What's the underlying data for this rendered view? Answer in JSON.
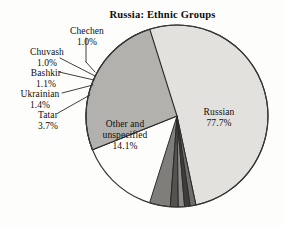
{
  "chart_data": {
    "type": "pie",
    "title": "Russia: Ethnic Groups",
    "xlabel": "",
    "ylabel": "",
    "legend": "none",
    "grid": false,
    "units": "percent",
    "categories": [
      "Russian",
      "Other and unspecified",
      "Tatar",
      "Ukrainian",
      "Bashkir",
      "Chuvash",
      "Chechen"
    ],
    "values": [
      77.7,
      14.1,
      3.7,
      1.4,
      1.1,
      1.0,
      1.0
    ],
    "slices": [
      {
        "name": "Russian",
        "label": "Russian",
        "value": 77.7,
        "value_text": "77.7%",
        "color": "#e2e1de",
        "label_placement": "inside"
      },
      {
        "name": "Other and unspecified",
        "label_line1": "Other and",
        "label_line2": "unspecified",
        "value": 14.1,
        "value_text": "14.1%",
        "color": "#b2b1ad",
        "label_placement": "inside"
      },
      {
        "name": "Tatar",
        "label": "Tatar",
        "value": 3.7,
        "value_text": "3.7%",
        "color": "#7f7e7a",
        "label_placement": "callout"
      },
      {
        "name": "Ukrainian",
        "label": "Ukrainian",
        "value": 1.4,
        "value_text": "1.4%",
        "color": "#545350",
        "label_placement": "callout"
      },
      {
        "name": "Bashkir",
        "label": "Bashkir",
        "value": 1.1,
        "value_text": "1.1%",
        "color": "#8d8c88",
        "label_placement": "callout"
      },
      {
        "name": "Chuvash",
        "label": "Chuvash",
        "value": 1.0,
        "value_text": "1.0%",
        "color": "#3e3d3b",
        "label_placement": "callout"
      },
      {
        "name": "Chechen",
        "label": "Chechen",
        "value": 1.0,
        "value_text": "1.0%",
        "color": "#6f6e6a",
        "label_placement": "callout"
      }
    ],
    "total": 100.0
  },
  "title": {
    "text": "Russia: Ethnic Groups"
  },
  "labels": {
    "chechen": {
      "name": "Chechen",
      "pct": "1.0%"
    },
    "chuvash": {
      "name": "Chuvash",
      "pct": "1.0%"
    },
    "bashkir": {
      "name": "Bashkir",
      "pct": "1.1%"
    },
    "ukrainian": {
      "name": "Ukrainian",
      "pct": "1.4%"
    },
    "tatar": {
      "name": "Tatar",
      "pct": "3.7%"
    },
    "other": {
      "line1": "Other and",
      "line2": "unspecified",
      "pct": "14.1%"
    },
    "russian": {
      "name": "Russian",
      "pct": "77.7%"
    }
  },
  "colors": {
    "background": "#fdfdfc",
    "outline": "#2b2a28",
    "russian": "#e2e1de",
    "other": "#b2b1ad",
    "tatar": "#7f7e7a",
    "ukrainian": "#545350",
    "bashkir": "#8d8c88",
    "chuvash": "#3e3d3b",
    "chechen": "#6f6e6a",
    "text": "#100d0c"
  }
}
